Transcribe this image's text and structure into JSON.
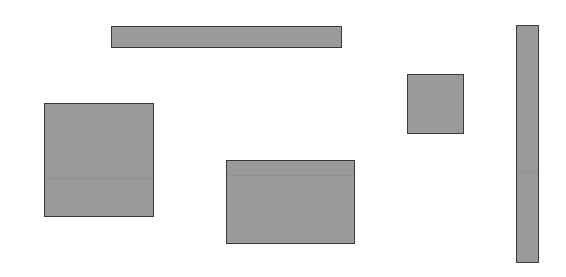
{
  "canvas": {
    "width": 566,
    "height": 277,
    "background": "#ffffff"
  },
  "style": {
    "fill": "#9a9a9a",
    "stroke": "#3a3a3a"
  },
  "shapes": [
    {
      "id": "top-horizontal-bar",
      "x": 111,
      "y": 26,
      "w": 231,
      "h": 22,
      "seam_y": null
    },
    {
      "id": "left-square",
      "x": 44,
      "y": 103,
      "w": 110,
      "h": 114,
      "seam_y": 74
    },
    {
      "id": "center-rectangle",
      "x": 226,
      "y": 160,
      "w": 129,
      "h": 84,
      "seam_y": 14
    },
    {
      "id": "small-square",
      "x": 407,
      "y": 74,
      "w": 57,
      "h": 60,
      "seam_y": null
    },
    {
      "id": "right-vertical-bar",
      "x": 516,
      "y": 25,
      "w": 23,
      "h": 238,
      "seam_y": 146
    }
  ]
}
